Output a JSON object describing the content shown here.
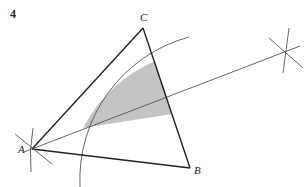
{
  "question_number": "4",
  "vertices": {
    "A": {
      "label": "A",
      "x": 32,
      "y": 149
    },
    "B": {
      "label": "B",
      "x": 190,
      "y": 168
    },
    "C": {
      "label": "C",
      "x": 143,
      "y": 28
    }
  },
  "construction": {
    "bisector_end": {
      "x": 300,
      "y": 46
    },
    "arc_center": "A",
    "arc_radius": 148,
    "shaded_region": "region inside triangle between arc, side CB and angle bisector from A"
  },
  "colors": {
    "line": "#222222",
    "construction": "#555555",
    "shade": "#c4c4c4"
  }
}
